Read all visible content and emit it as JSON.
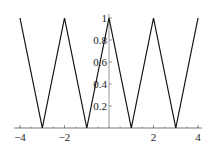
{
  "chart_data": {
    "type": "line",
    "title": "",
    "xlabel": "",
    "ylabel": "",
    "xlim": [
      -4,
      4
    ],
    "ylim": [
      0,
      1
    ],
    "grid": false,
    "legend": null,
    "series": [
      {
        "name": "triangle wave",
        "x": [
          -4,
          -3,
          -2,
          -1,
          0,
          1,
          2,
          3,
          4
        ],
        "y": [
          1,
          0,
          1,
          0,
          1,
          0,
          1,
          0,
          1
        ]
      }
    ],
    "x_ticks": [
      -4,
      -2,
      2,
      4
    ],
    "x_tick_labels": [
      "−4",
      "−2",
      "2",
      "4"
    ],
    "y_ticks": [
      0.2,
      0.4,
      0.6,
      0.8,
      1
    ],
    "y_tick_labels": [
      "0.2",
      "0.4",
      "0.6",
      "0.8",
      "1"
    ],
    "colors": {
      "line": "#111111",
      "axis": "#555555"
    }
  }
}
